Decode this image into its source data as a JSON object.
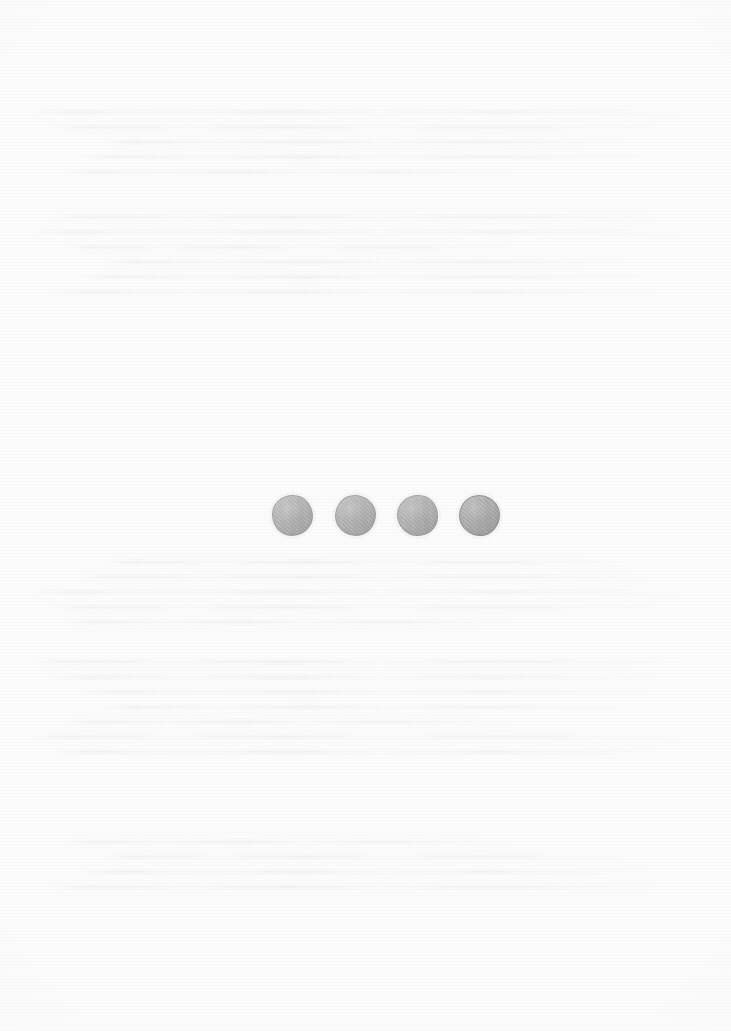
{
  "page": {
    "kind": "scanned-paper-page",
    "width": 731,
    "height": 1031,
    "background_color": "#fcfcfc",
    "has_legible_text": false,
    "caption": ""
  },
  "artifacts": {
    "bleed_through_label": "faint show-through text from reverse side of sheet (illegible)",
    "ghost_blocks": [
      {
        "top": 110,
        "lines": [
          "w-c",
          "w-a",
          "w-b",
          "w-e",
          "w-d"
        ]
      },
      {
        "top": 215,
        "lines": [
          "w-a",
          "w-c",
          "w-d",
          "w-b",
          "w-e",
          "w-a"
        ]
      },
      {
        "top": 560,
        "lines": [
          "w-b",
          "w-e",
          "w-c",
          "w-a",
          "w-d"
        ]
      },
      {
        "top": 660,
        "lines": [
          "w-c",
          "w-a",
          "w-e",
          "w-b",
          "w-d",
          "w-c",
          "w-a"
        ]
      },
      {
        "top": 840,
        "lines": [
          "w-d",
          "w-b",
          "w-e",
          "w-a"
        ]
      }
    ]
  },
  "figure": {
    "name": "row-of-four-circles",
    "count": 4,
    "fill_color": "#b2b2b2",
    "outline_color": "#8a8a8a",
    "diameter_px": 41,
    "center_y_px": 515,
    "spacing_px": 62,
    "circles": [
      {
        "label": "circle-1",
        "center_x_px": 292,
        "fill_color": "#b4b4b4"
      },
      {
        "label": "circle-2",
        "center_x_px": 355,
        "fill_color": "#b3b3b3"
      },
      {
        "label": "circle-3",
        "center_x_px": 417,
        "fill_color": "#b1b1b1"
      },
      {
        "label": "circle-4",
        "center_x_px": 479,
        "fill_color": "#aaaaaa"
      }
    ]
  }
}
